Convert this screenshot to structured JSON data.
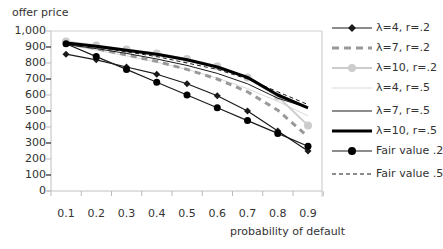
{
  "chart_data": {
    "type": "line",
    "title": "",
    "ylabel": "offer price",
    "xlabel": "probability of default",
    "ylim": [
      0,
      1000
    ],
    "yticks": [
      "0",
      "100",
      "200",
      "300",
      "400",
      "500",
      "600",
      "700",
      "800",
      "900",
      "1,000"
    ],
    "x": [
      0.1,
      0.2,
      0.3,
      0.4,
      0.5,
      0.6,
      0.7,
      0.8,
      0.9
    ],
    "xticks": [
      "0.1",
      "0.2",
      "0.3",
      "0.4",
      "0.5",
      "0.6",
      "0.7",
      "0.8",
      "0.9"
    ],
    "grid": false,
    "legend_position": "right",
    "series": [
      {
        "name": "λ=4, r=.2",
        "color": "#1a1a1a",
        "width": 1.2,
        "dash": "",
        "marker": "diamond",
        "values": [
          855,
          820,
          775,
          730,
          670,
          595,
          500,
          375,
          250
        ]
      },
      {
        "name": "λ=7, r=.2",
        "color": "#999999",
        "width": 3,
        "dash": "6,5",
        "marker": "none",
        "values": [
          925,
          890,
          850,
          810,
          760,
          700,
          620,
          505,
          340
        ]
      },
      {
        "name": "λ=10, r=.2",
        "color": "#cccccc",
        "width": 2,
        "dash": "",
        "marker": "circle-light",
        "values": [
          935,
          910,
          885,
          860,
          825,
          780,
          710,
          590,
          410
        ]
      },
      {
        "name": "λ=4, r=.5",
        "color": "#d9d9d9",
        "width": 1,
        "dash": "",
        "marker": "none",
        "values": [
          915,
          880,
          845,
          805,
          760,
          705,
          640,
          560,
          470
        ]
      },
      {
        "name": "λ=7, r=.5",
        "color": "#1a1a1a",
        "width": 1,
        "dash": "",
        "marker": "none",
        "values": [
          915,
          890,
          860,
          825,
          785,
          735,
          670,
          580,
          520
        ]
      },
      {
        "name": "λ=10, r=.5",
        "color": "#000000",
        "width": 3,
        "dash": "",
        "marker": "none",
        "values": [
          925,
          905,
          880,
          855,
          820,
          775,
          710,
          600,
          520
        ]
      },
      {
        "name": "Fair value .2",
        "color": "#1a1a1a",
        "width": 1.2,
        "dash": "",
        "marker": "circle",
        "values": [
          920,
          840,
          760,
          680,
          600,
          520,
          440,
          360,
          280
        ]
      },
      {
        "name": "Fair value .5",
        "color": "#1a1a1a",
        "width": 1,
        "dash": "4,3",
        "marker": "none",
        "values": [
          930,
          900,
          870,
          840,
          800,
          760,
          700,
          620,
          540
        ]
      }
    ]
  },
  "axes": {
    "ylabel": "offer price",
    "xlabel": "probability of default"
  },
  "legend": {
    "items": [
      "λ=4, r=.2",
      "λ=7, r=.2",
      "λ=10, r=.2",
      "λ=4, r=.5",
      "λ=7, r=.5",
      "λ=10, r=.5",
      "Fair value .2",
      "Fair value .5"
    ]
  }
}
